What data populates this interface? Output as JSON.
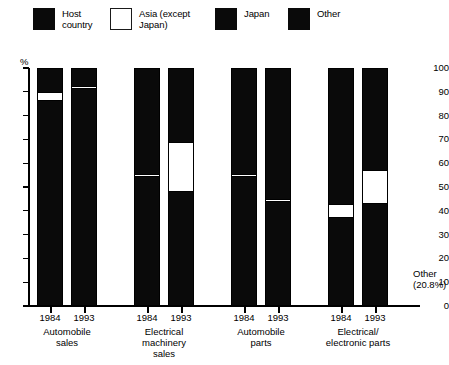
{
  "chart_data": {
    "type": "bar",
    "subtype": "stacked-column",
    "title": "",
    "xlabel": "",
    "ylabel": "%",
    "ylim": [
      0,
      100
    ],
    "yticks": [
      0,
      10,
      20,
      30,
      40,
      50,
      60,
      70,
      80,
      90,
      100
    ],
    "grid": false,
    "legend_position": "top",
    "legend": [
      {
        "key": "host",
        "label": "Host\ncountry",
        "fill": "solid-black",
        "color": "#0a0a0a"
      },
      {
        "key": "asia",
        "label": "Asia (except\nJapan)",
        "fill": "white-outline",
        "color": "#ffffff"
      },
      {
        "key": "japan",
        "label": "Japan",
        "fill": "solid-black",
        "color": "#0a0a0a"
      },
      {
        "key": "other",
        "label": "Other",
        "fill": "solid-black",
        "color": "#0a0a0a"
      }
    ],
    "groups": [
      {
        "label": "Automobile\nsales",
        "years": [
          "1984",
          "1993"
        ]
      },
      {
        "label": "Electrical\nmachinery\nsales",
        "years": [
          "1984",
          "1993"
        ]
      },
      {
        "label": "Automobile\nparts",
        "years": [
          "1984",
          "1993"
        ]
      },
      {
        "label": "Electrical/\nelectronic parts",
        "years": [
          "1984",
          "1993"
        ]
      }
    ],
    "categories": [
      "Automobile sales 1984",
      "Automobile sales 1993",
      "Electrical machinery sales 1984",
      "Electrical machinery sales 1993",
      "Automobile parts 1984",
      "Automobile parts 1993",
      "Electrical/electronic parts 1984",
      "Electrical/electronic parts 1993"
    ],
    "series": [
      {
        "name": "Host country",
        "values": [
          86.0,
          91.0,
          54.0,
          48.0,
          54.0,
          44.0,
          37.0,
          43.0
        ]
      },
      {
        "name": "Asia (except Japan)",
        "values": [
          4.0,
          1.5,
          1.5,
          21.0,
          1.5,
          1.5,
          6.0,
          14.0
        ]
      },
      {
        "name": "Japan",
        "values": [
          10.0,
          7.5,
          44.5,
          31.0,
          44.5,
          54.5,
          57.0,
          43.0
        ]
      },
      {
        "name": "Other",
        "values": [
          0.0,
          0.0,
          0.0,
          0.0,
          0.0,
          0.0,
          0.0,
          0.0
        ]
      }
    ],
    "bars": [
      {
        "group": 0,
        "year": "1984",
        "segments": [
          {
            "key": "host",
            "from": 0.0,
            "to": 86.0
          },
          {
            "key": "asia",
            "from": 86.0,
            "to": 90.0
          },
          {
            "key": "japan",
            "from": 90.0,
            "to": 100.0
          }
        ]
      },
      {
        "group": 0,
        "year": "1993",
        "segments": [
          {
            "key": "host",
            "from": 0.0,
            "to": 91.0
          },
          {
            "key": "asia",
            "from": 91.0,
            "to": 92.5
          },
          {
            "key": "japan",
            "from": 92.5,
            "to": 100.0
          }
        ]
      },
      {
        "group": 1,
        "year": "1984",
        "segments": [
          {
            "key": "host",
            "from": 0.0,
            "to": 54.0
          },
          {
            "key": "asia",
            "from": 54.0,
            "to": 55.5
          },
          {
            "key": "japan",
            "from": 55.5,
            "to": 100.0
          }
        ]
      },
      {
        "group": 1,
        "year": "1993",
        "segments": [
          {
            "key": "host",
            "from": 0.0,
            "to": 48.0
          },
          {
            "key": "asia",
            "from": 48.0,
            "to": 69.0
          },
          {
            "key": "japan",
            "from": 69.0,
            "to": 100.0
          }
        ]
      },
      {
        "group": 2,
        "year": "1984",
        "segments": [
          {
            "key": "host",
            "from": 0.0,
            "to": 54.0
          },
          {
            "key": "asia",
            "from": 54.0,
            "to": 55.5
          },
          {
            "key": "japan",
            "from": 55.5,
            "to": 100.0
          }
        ]
      },
      {
        "group": 2,
        "year": "1993",
        "segments": [
          {
            "key": "host",
            "from": 0.0,
            "to": 43.5
          },
          {
            "key": "asia",
            "from": 43.5,
            "to": 45.0
          },
          {
            "key": "japan",
            "from": 45.0,
            "to": 100.0
          }
        ]
      },
      {
        "group": 3,
        "year": "1984",
        "segments": [
          {
            "key": "host",
            "from": 0.0,
            "to": 37.0
          },
          {
            "key": "asia",
            "from": 37.0,
            "to": 43.0
          },
          {
            "key": "japan",
            "from": 43.0,
            "to": 100.0
          }
        ]
      },
      {
        "group": 3,
        "year": "1993",
        "segments": [
          {
            "key": "host",
            "from": 0.0,
            "to": 43.0
          },
          {
            "key": "asia",
            "from": 43.0,
            "to": 57.0
          },
          {
            "key": "japan",
            "from": 57.0,
            "to": 100.0
          }
        ]
      }
    ],
    "annotations": [
      {
        "text": "Other\n(20.8%)",
        "position": "right-edge",
        "clipped": true
      }
    ]
  }
}
